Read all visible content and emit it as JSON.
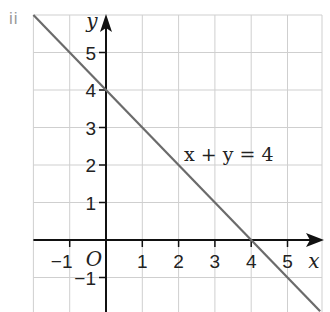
{
  "part_label": "ii",
  "chart_data": {
    "type": "line",
    "title": "",
    "xlabel": "x",
    "ylabel": "y",
    "origin_label": "O",
    "xlim": [
      -2,
      5.9
    ],
    "ylim": [
      -1.9,
      6
    ],
    "grid": true,
    "x_ticks": [
      -1,
      1,
      2,
      3,
      4,
      5
    ],
    "x_tick_labels": [
      "−1",
      "1",
      "2",
      "3",
      "4",
      "5"
    ],
    "y_ticks": [
      -1,
      1,
      2,
      3,
      4,
      5
    ],
    "y_tick_labels": [
      "−1",
      "1",
      "2",
      "3",
      "4",
      "5"
    ],
    "series": [
      {
        "name": "x + y = 4",
        "equation": "x + y = 4",
        "x": [
          -2,
          5.9
        ],
        "y": [
          6,
          -1.9
        ],
        "color": "#6b6b6b"
      }
    ],
    "annotations": [
      {
        "text": "x + y = 4",
        "x": 2.1,
        "y": 2.3
      }
    ]
  },
  "colors": {
    "grid": "#cfcfcf",
    "axis": "#111111",
    "line": "#6b6b6b",
    "label": "#9a9a9a"
  }
}
